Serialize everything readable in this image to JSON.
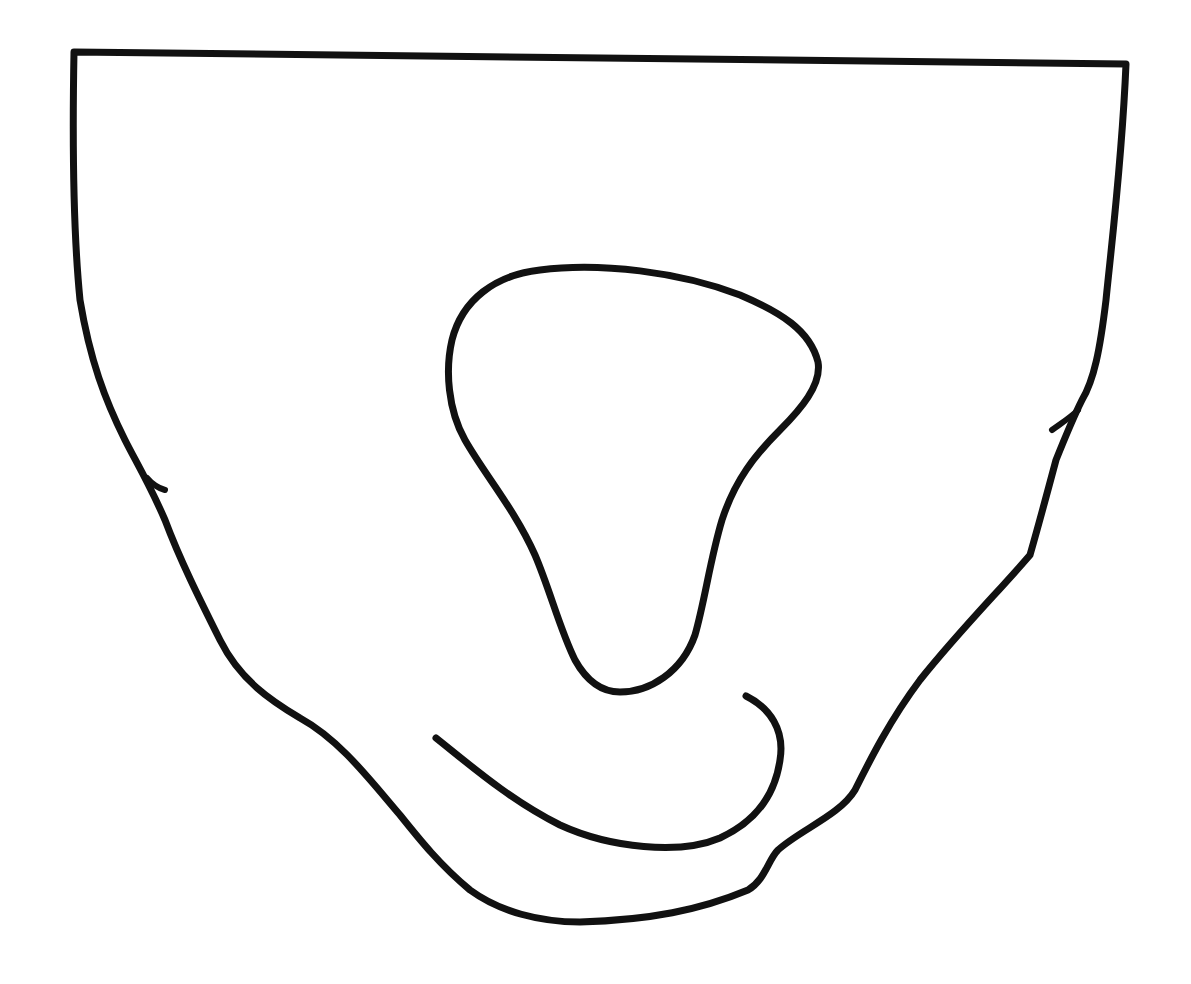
{
  "drawing": {
    "description": "Hand-drawn black line illustration of a U-shaped vessel outline containing a teardrop loop and a curved hook stroke",
    "background": "#ffffff",
    "stroke_color": "#111111",
    "width": 1191,
    "height": 984,
    "strokes": [
      {
        "name": "outer-vessel-outline",
        "width": 7,
        "d": "M 74 52 L 1126 64 C 1122 160 1112 240 1106 300 C 1100 350 1094 380 1082 400 C 1072 420 1064 440 1056 460 C 1048 490 1040 520 1030 555 C 1000 590 960 630 920 680 C 890 720 870 760 855 790 C 840 815 800 830 778 850 C 768 860 765 880 748 890 C 700 910 650 920 580 922 C 540 922 500 912 470 890 C 440 865 420 840 400 815 C 370 780 340 740 300 718 C 270 700 240 680 220 640 C 200 600 180 560 165 520 C 150 485 135 460 125 440 C 105 400 90 360 80 300 C 74 240 72 160 74 52 Z"
      },
      {
        "name": "left-side-notch",
        "width": 6,
        "d": "M 147 478 C 152 484 158 488 165 490"
      },
      {
        "name": "right-side-notch",
        "width": 6,
        "d": "M 1078 410 C 1070 418 1060 424 1052 430"
      },
      {
        "name": "inner-teardrop-loop",
        "width": 7,
        "d": "M 620 692 C 600 692 585 678 575 660 C 560 630 550 590 535 555 C 515 510 485 475 465 440 C 448 410 445 370 452 340 C 462 300 495 275 540 270 C 600 262 680 272 740 295 C 780 312 810 330 818 362 C 822 385 800 410 780 430 C 755 455 735 480 722 520 C 710 560 705 600 695 635 C 682 672 650 692 620 692 Z"
      },
      {
        "name": "inner-curved-hook",
        "width": 7,
        "d": "M 436 738 C 470 765 510 800 560 825 C 610 848 680 855 720 838 C 755 822 775 795 780 760 C 785 730 770 708 746 696"
      }
    ]
  }
}
